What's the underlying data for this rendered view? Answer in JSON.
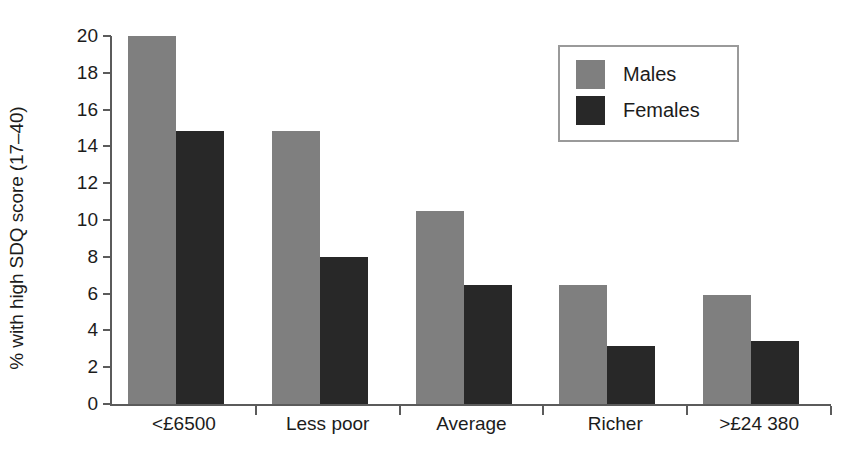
{
  "chart_data": {
    "type": "bar",
    "title": "",
    "subtitle": "",
    "xlabel": "",
    "ylabel": "% with high SDQ score (17–40)",
    "categories": [
      "<£6500",
      "Less poor",
      "Average",
      "Richer",
      ">£24 380"
    ],
    "series": [
      {
        "name": "Males",
        "color": "#7f7f7f",
        "values": [
          20.0,
          14.85,
          10.5,
          6.45,
          5.95
        ]
      },
      {
        "name": "Females",
        "color": "#282828",
        "values": [
          14.85,
          8.0,
          6.45,
          3.15,
          3.4
        ]
      }
    ],
    "ylim": [
      0,
      20
    ],
    "ytick_values": [
      0,
      2,
      4,
      6,
      8,
      10,
      12,
      14,
      16,
      18,
      20
    ],
    "ytick_labels": [
      "0",
      "2",
      "4",
      "6",
      "8",
      "10",
      "12",
      "14",
      "16",
      "18",
      "20"
    ],
    "grid": false,
    "legend_position": "top-right",
    "legend_entries": [
      "Males",
      "Females"
    ]
  },
  "axes": {
    "y_title": "% with high SDQ score (17–40)",
    "y_ticks": [
      "20",
      "18",
      "16",
      "14",
      "12",
      "10",
      "8",
      "6",
      "4",
      "2",
      "0"
    ],
    "x_ticks": [
      "<£6500",
      "Less poor",
      "Average",
      "Richer",
      ">£24 380"
    ]
  },
  "legend": {
    "items": [
      {
        "label": "Males",
        "color": "#7f7f7f"
      },
      {
        "label": "Females",
        "color": "#282828"
      }
    ]
  },
  "colors": {
    "males": "#7f7f7f",
    "females": "#282828",
    "axis": "#5b5b5b",
    "text": "#1c1c1c",
    "legend_border": "#9a9a9a",
    "background": "#ffffff"
  }
}
